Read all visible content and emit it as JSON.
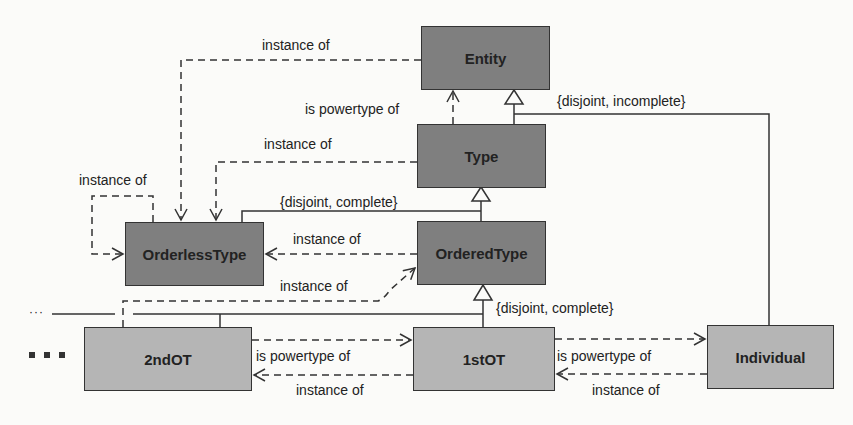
{
  "diagram": {
    "type": "UML class diagram (powertype hierarchy)",
    "colors": {
      "dark_box": "#7f7f7f",
      "light_box": "#b5b5b5",
      "line": "#333333",
      "background": "#fbfbf9"
    },
    "classes": {
      "entity": "Entity",
      "type": "Type",
      "orderless_type": "OrderlessType",
      "ordered_type": "OrderedType",
      "second_ot": "2ndOT",
      "first_ot": "1stOT",
      "individual": "Individual"
    },
    "labels": {
      "entity_instance_of": "instance of",
      "type_is_powertype_of": "is powertype of",
      "type_instance_of": "instance of",
      "orderless_self_instance_of": "instance of",
      "entity_generalization_set": "{disjoint, incomplete}",
      "type_generalization_set": "{disjoint, complete}",
      "ordered_to_orderless_instance_of": "instance of",
      "second_ot_instance_of_ordered": "instance of",
      "ordered_generalization_set": "{disjoint, complete}",
      "second_first_is_powertype_of": "is powertype of",
      "second_first_instance_of": "instance of",
      "first_individual_is_powertype_of": "is powertype of",
      "first_individual_instance_of": "instance of"
    },
    "continuation": {
      "small_dots": "···",
      "large_dots": "■ ■ ■"
    }
  }
}
